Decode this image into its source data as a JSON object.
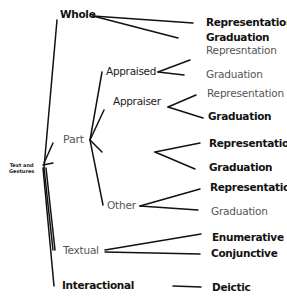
{
  "diagram": {
    "root": {
      "line1": "Text and",
      "line2": "Gestures"
    },
    "nodes": {
      "whole": "Whole",
      "part": "Part",
      "appraised": "Appraised",
      "appraiser": "Appraiser",
      "other": "Other",
      "textual": "Textual",
      "interactional": "Interactional"
    },
    "leaves": {
      "whole_rep": "Representation",
      "whole_grad": "Graduation",
      "appraised_rep": "Represntation",
      "appraised_grad": "Graduation",
      "appraiser_rep": "Representation",
      "appraiser_grad": "Graduation",
      "part_unlabeled_rep": "Representation",
      "part_unlabeled_grad": "Graduation",
      "other_rep": "Representation",
      "other_grad": "Graduation",
      "textual_enum": "Enumerative",
      "textual_conj": "Conjunctive",
      "interactional_deictic": "Deictic"
    }
  }
}
